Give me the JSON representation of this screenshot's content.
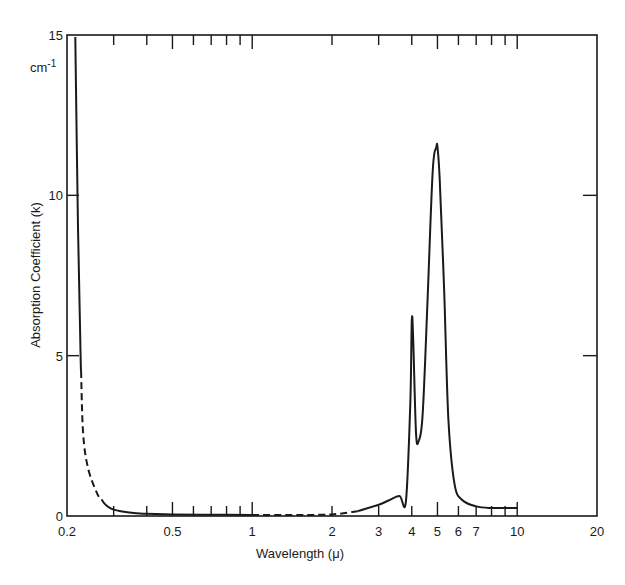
{
  "chart_data": {
    "type": "line",
    "title": "",
    "xlabel": "Wavelength (μ)",
    "ylabel": "Absorption Coefficient (k)",
    "yunit": "cm-1",
    "xscale": "log",
    "xlim": [
      0.2,
      20
    ],
    "ylim": [
      0,
      15
    ],
    "grid": false,
    "legend": null,
    "x_tick_labels": [
      "0.2",
      "0.5",
      "1",
      "2",
      "3",
      "4",
      "5",
      "6",
      "7",
      "10",
      "20"
    ],
    "x_tick_values": [
      0.2,
      0.5,
      1,
      2,
      3,
      4,
      5,
      6,
      7,
      10,
      20
    ],
    "y_tick_labels": [
      "0",
      "5",
      "10",
      "15"
    ],
    "y_tick_values": [
      0,
      5,
      10,
      15
    ],
    "series": [
      {
        "name": "Absorption coefficient",
        "x": [
          0.215,
          0.22,
          0.225,
          0.23,
          0.24,
          0.26,
          0.28,
          0.3,
          0.35,
          0.4,
          0.5,
          0.7,
          1.0,
          1.5,
          2.0,
          2.5,
          3.0,
          3.3,
          3.6,
          3.8,
          3.95,
          4.0,
          4.05,
          4.15,
          4.25,
          4.4,
          4.6,
          4.8,
          4.95,
          5.0,
          5.1,
          5.3,
          5.5,
          5.8,
          6.2,
          7.0,
          8.0,
          10.0
        ],
        "values": [
          15,
          9.0,
          5.0,
          2.6,
          1.5,
          0.7,
          0.35,
          0.2,
          0.1,
          0.07,
          0.05,
          0.04,
          0.03,
          0.03,
          0.05,
          0.15,
          0.35,
          0.5,
          0.62,
          0.45,
          3.5,
          6.1,
          5.5,
          2.6,
          2.35,
          3.2,
          7.0,
          10.8,
          11.5,
          11.5,
          10.5,
          7.0,
          3.0,
          1.0,
          0.5,
          0.3,
          0.25,
          0.25
        ]
      }
    ],
    "annotations": {
      "dashed_segments": [
        "0.225-0.27 μ (extrapolated)",
        "1-2.5 μ (extrapolated)"
      ],
      "peaks": [
        {
          "x": 3.6,
          "y": 0.62,
          "label": "shoulder"
        },
        {
          "x": 4.0,
          "y": 6.1,
          "label": "peak"
        },
        {
          "x": 4.25,
          "y": 2.35,
          "label": "valley"
        },
        {
          "x": 5.0,
          "y": 11.5,
          "label": "main peak"
        }
      ]
    }
  },
  "axes": {
    "x_title": "Wavelength (μ)",
    "y_title": "Absorption Coefficient (k)",
    "y_unit": "cm-1",
    "x_ticks": [
      "0.2",
      "0.5",
      "1",
      "2",
      "3",
      "4",
      "5",
      "6",
      "7",
      "10",
      "20"
    ],
    "y_ticks": [
      "0",
      "5",
      "10",
      "15"
    ]
  }
}
